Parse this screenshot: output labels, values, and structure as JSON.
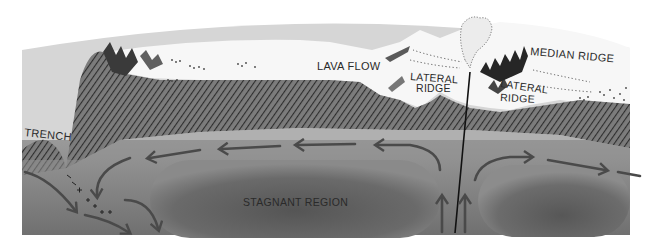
{
  "diagram": {
    "labels": {
      "trench": "TRENCH",
      "lava_flow": "LAVA FLOW",
      "lateral_ridge_left_line1": "LATERAL",
      "lateral_ridge_left_line2": "RIDGE",
      "median_ridge": "MEDIAN RIDGE",
      "lateral_ridge_right_line1": "LATERAL",
      "lateral_ridge_right_line2": "RIDGE",
      "stagnant_region": "STAGNANT REGION"
    },
    "colors": {
      "sky": "#d6d6d6",
      "lava_surface": "#f7f7f7",
      "crust_hatch": "#3a3a3a",
      "mantle_upper": "#8e8e8e",
      "mantle_core": "#606060",
      "arrow": "#4a4a4a",
      "rift_line": "#111111"
    },
    "flow_arrows": [
      {
        "region": "upper-left",
        "direction": "left"
      },
      {
        "region": "upper-left-mid",
        "direction": "left"
      },
      {
        "region": "upper-center",
        "direction": "left"
      },
      {
        "region": "rift-left-rise",
        "direction": "up"
      },
      {
        "region": "rift-right-rise",
        "direction": "up"
      },
      {
        "region": "upper-right",
        "direction": "right"
      },
      {
        "region": "upper-far-right",
        "direction": "right"
      },
      {
        "region": "trench-descent",
        "direction": "down"
      }
    ]
  }
}
